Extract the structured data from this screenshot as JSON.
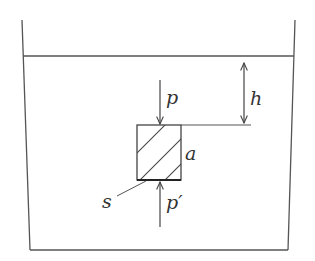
{
  "diagram": {
    "type": "hydrostatic-pressure-on-submerged-cube",
    "labels": {
      "p": "p",
      "p_prime": "p′",
      "h": "h",
      "a": "a",
      "s": "s"
    },
    "colors": {
      "stroke": "#444444",
      "text": "#333333",
      "background": "#ffffff"
    },
    "elements": [
      {
        "name": "container",
        "desc": "open tapered vessel"
      },
      {
        "name": "water-surface",
        "desc": "horizontal free-surface line"
      },
      {
        "name": "cube",
        "desc": "hatched submerged block of side a"
      },
      {
        "name": "arrow-p",
        "desc": "downward pressure on top face"
      },
      {
        "name": "arrow-p-prime",
        "desc": "upward pressure on bottom face"
      },
      {
        "name": "depth-arrow-h",
        "desc": "double arrow showing depth h of top face"
      },
      {
        "name": "leader-s",
        "desc": "leader line to bottom face area s"
      }
    ]
  }
}
